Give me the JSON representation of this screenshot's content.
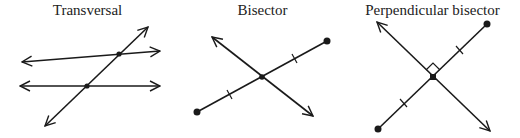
{
  "panels": [
    {
      "title": "Transversal",
      "elements": [
        "two lines (with arrows both ends)",
        "transversal line (with arrows both ends)",
        "2 intersection points"
      ]
    },
    {
      "title": "Bisector",
      "elements": [
        "segment with endpoints",
        "bisecting line with arrows",
        "midpoint",
        "2 congruence tick marks"
      ]
    },
    {
      "title": "Perpendicular bisector",
      "elements": [
        "segment with endpoints",
        "perpendicular line with arrows",
        "midpoint",
        "right-angle mark",
        "2 congruence tick marks"
      ]
    }
  ],
  "colors": {
    "stroke": "#1a1a1a",
    "background": "#ffffff"
  }
}
